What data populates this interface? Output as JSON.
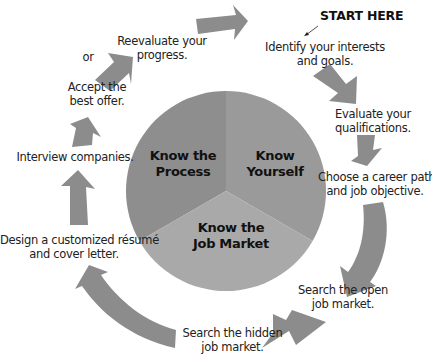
{
  "diagram": {
    "type": "cycle",
    "start_marker": "START HERE",
    "center": {
      "segments": [
        {
          "label": "Know the Process",
          "line1": "Know the",
          "line2": "Process",
          "color": "#8e8e8e"
        },
        {
          "label": "Know Yourself",
          "line1": "Know",
          "line2": "Yourself",
          "color": "#999999"
        },
        {
          "label": "Know the Job Market",
          "line1": "Know the",
          "line2": "Job Market",
          "color": "#a9a9a9"
        }
      ]
    },
    "steps": [
      {
        "line1": "Identify your interests",
        "line2": "and goals."
      },
      {
        "line1": "Evaluate your",
        "line2": "qualifications."
      },
      {
        "line1": "Choose a career path",
        "line2": "and job objective."
      },
      {
        "line1": "Search the open",
        "line2": "job market."
      },
      {
        "line1": "Search the hidden",
        "line2": "job market."
      },
      {
        "line1": "Design a customized résumé",
        "line2": "and cover letter."
      },
      {
        "line1": "Interview companies."
      },
      {
        "line1": "Accept the",
        "line2": "best offer."
      },
      {
        "line1": "Reevaluate your",
        "line2": "progress."
      }
    ],
    "connector_or": "or",
    "arrow_color": "#8a8a8a"
  }
}
